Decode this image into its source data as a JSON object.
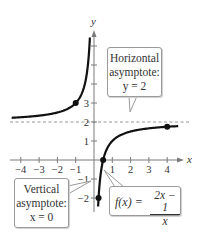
{
  "chart_data": {
    "type": "line",
    "title": "",
    "function": "f(x) = (2x - 1)/x",
    "xlabel": "x",
    "ylabel": "y",
    "xlim": [
      -4.5,
      4.6
    ],
    "ylim": [
      -2.4,
      6.5
    ],
    "x_ticks": [
      -4,
      -3,
      -2,
      -1,
      1,
      2,
      3,
      4
    ],
    "y_ticks": [
      -2,
      -1,
      1,
      2,
      3
    ],
    "y_tick_marks_unlabeled": [
      4,
      5,
      6
    ],
    "grid": false,
    "series": [
      {
        "name": "f(x) left branch",
        "x": [
          -4.5,
          -4,
          -3,
          -2,
          -1,
          -0.5,
          -0.3,
          -0.25
        ],
        "values": [
          2.22,
          2.25,
          2.33,
          2.5,
          3,
          4,
          5.33,
          6
        ]
      },
      {
        "name": "f(x) right branch",
        "x": [
          0.23,
          0.25,
          0.333,
          0.5,
          1,
          2,
          3,
          4,
          4.6
        ],
        "values": [
          -2.35,
          -2,
          -1,
          0,
          1,
          1.5,
          1.67,
          1.75,
          1.78
        ]
      }
    ],
    "marked_points": [
      {
        "x": -1,
        "y": 3
      },
      {
        "x": 0.25,
        "y": -2
      },
      {
        "x": 0.5,
        "y": 0
      },
      {
        "x": 4,
        "y": 1.75
      }
    ],
    "asymptotes": [
      {
        "type": "horizontal",
        "y": 2,
        "style": "dashed"
      },
      {
        "type": "vertical",
        "x": 0
      }
    ],
    "annotations": [
      {
        "text": "Horizontal asymptote: y = 2"
      },
      {
        "text": "Vertical asymptote: x = 0"
      },
      {
        "text": "f(x) = (2x − 1)/x"
      }
    ]
  },
  "labels": {
    "x_axis": "x",
    "y_axis": "y",
    "x_tick_labels": [
      "−4",
      "−3",
      "−2",
      "−1",
      "1",
      "2",
      "3",
      "4"
    ],
    "y_tick_labels": [
      "3",
      "2",
      "1",
      "−1",
      "−2"
    ]
  },
  "callouts": {
    "horizontal": {
      "line1": "Horizontal",
      "line2": "asymptote:",
      "line3": "y = 2"
    },
    "vertical": {
      "line1": "Vertical",
      "line2": "asymptote:",
      "line3": "x = 0"
    },
    "function": {
      "lhs": "f(x) =",
      "numerator": "2x − 1",
      "denominator": "x"
    }
  }
}
